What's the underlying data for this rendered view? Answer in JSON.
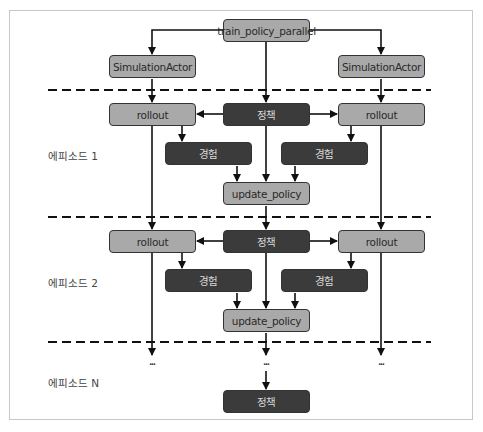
{
  "diagram": {
    "root": {
      "label": "train_policy_parallel"
    },
    "actors": [
      {
        "label": "SimulationActor"
      },
      {
        "label": "SimulationActor"
      }
    ],
    "episodes": [
      {
        "label": "에피소드 1",
        "rollouts": [
          "rollout",
          "rollout"
        ],
        "policy": "정책",
        "experiences": [
          "경험",
          "경험"
        ],
        "update": "update_policy"
      },
      {
        "label": "에피소드 2",
        "rollouts": [
          "rollout",
          "rollout"
        ],
        "policy": "정책",
        "experiences": [
          "경험",
          "경험"
        ],
        "update": "update_policy"
      },
      {
        "label": "에피소드 N",
        "continuation": [
          "...",
          "...",
          "..."
        ],
        "policy": "정책"
      }
    ],
    "colors": {
      "light_box": "#a9a9a9",
      "dark_box": "#3b3b3b",
      "line": "#111111",
      "frame": "#c8c8c8"
    }
  }
}
